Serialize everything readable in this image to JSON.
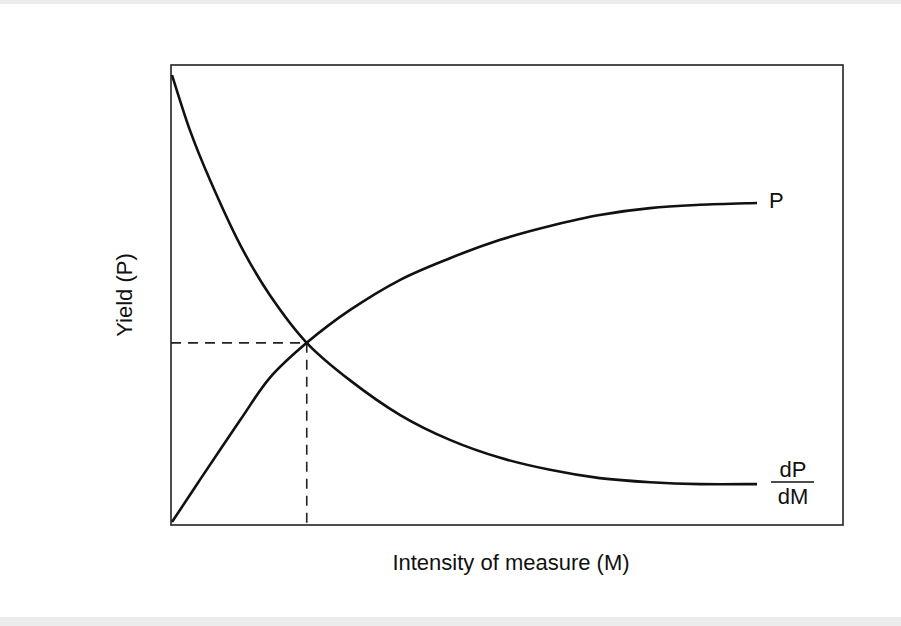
{
  "chart_data": {
    "type": "line",
    "title": "",
    "xlabel": "Intensity of measure (M)",
    "ylabel": "Yield (P)",
    "xlim": [
      0,
      1
    ],
    "ylim": [
      0,
      1
    ],
    "grid": false,
    "x_ticks": [],
    "y_ticks": [],
    "series": [
      {
        "name": "P",
        "label": "P",
        "style": "solid",
        "color": "#111111",
        "x": [
          0.0015,
          0.043,
          0.103,
          0.147,
          0.202,
          0.266,
          0.341,
          0.415,
          0.49,
          0.564,
          0.638,
          0.713,
          0.787,
          0.872
        ],
        "y": [
          0.0065,
          0.098,
          0.228,
          0.32,
          0.396,
          0.467,
          0.533,
          0.58,
          0.62,
          0.65,
          0.674,
          0.689,
          0.696,
          0.7
        ]
      },
      {
        "name": "dP/dM",
        "label_numerator": "dP",
        "label_denominator": "dM",
        "style": "solid",
        "color": "#111111",
        "x": [
          0.0015,
          0.028,
          0.058,
          0.103,
          0.147,
          0.202,
          0.266,
          0.341,
          0.415,
          0.49,
          0.564,
          0.638,
          0.713,
          0.787,
          0.872
        ],
        "y": [
          0.978,
          0.859,
          0.75,
          0.609,
          0.5,
          0.396,
          0.315,
          0.239,
          0.185,
          0.146,
          0.12,
          0.102,
          0.093,
          0.089,
          0.089
        ]
      }
    ],
    "annotations": [
      {
        "type": "dashed-guide",
        "description": "optimum intersection of P and dP/dM",
        "x": 0.202,
        "y": 0.396
      }
    ]
  }
}
